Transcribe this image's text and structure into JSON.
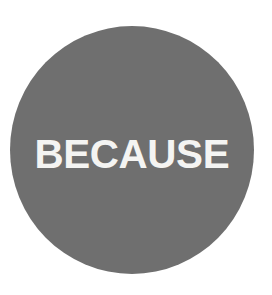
{
  "canvas": {
    "width": 272,
    "height": 295,
    "background_color": "#ffffff"
  },
  "badge": {
    "shape": "circle",
    "fill_color": "#6f6f6f",
    "text": "BECAUSE",
    "text_color": "#f4f4f2",
    "center_x": 132,
    "center_y": 150,
    "diameter": 245
  }
}
